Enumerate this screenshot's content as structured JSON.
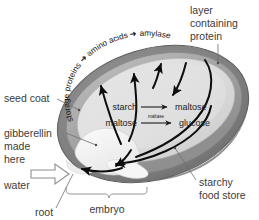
{
  "diagram": {
    "background_color": "#ffffff"
  },
  "labels": {
    "layer_containing_protein": "layer\ncontaining\nprotein",
    "layer_containing_protein_lines": [
      "layer",
      "containing",
      "protein"
    ],
    "seed_coat": "seed coat",
    "gibberellin_made_here_lines": [
      "gibberellin",
      "made",
      "here"
    ],
    "water": "water",
    "root": "root",
    "embryo": "embryo",
    "starchy_food_store_lines": [
      "starchy",
      "food store"
    ]
  },
  "aleurone_pathway": {
    "full_text": "storage proteins ➜ amino acids ➜ amylase",
    "steps": [
      "storage proteins",
      "amino acids",
      "amylase"
    ]
  },
  "reactions": [
    {
      "id": "starch-to-maltose",
      "substrate": "starch",
      "product": "maltose",
      "enzyme": ""
    },
    {
      "id": "maltose-to-glucose",
      "substrate": "maltose",
      "product": "glucose",
      "enzyme": "maltase"
    }
  ],
  "colors": {
    "seed_coat": "#808080",
    "aleurone_layer": "#a8a8a8",
    "endosperm": "#d9d9d9",
    "embryo": "#f2f2f2",
    "label_text": "#3b3b3b",
    "reaction_text": "#1c1c1c",
    "arrow": "#0d0d0d",
    "leader_line": "#6f6f6f"
  }
}
